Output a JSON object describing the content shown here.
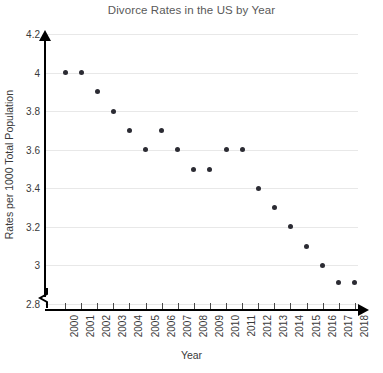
{
  "chart_data": {
    "type": "scatter",
    "title": "Divorce Rates in the US by Year",
    "xlabel": "Year",
    "ylabel": "Rates per 1000 Total Population",
    "categories": [
      "2000",
      "2001",
      "2002",
      "2003",
      "2004",
      "2005",
      "2006",
      "2007",
      "2008",
      "2009",
      "2010",
      "2011",
      "2012",
      "2013",
      "2014",
      "2015",
      "2016",
      "2017",
      "2018"
    ],
    "values": [
      4.0,
      4.0,
      3.9,
      3.8,
      3.7,
      3.6,
      3.7,
      3.6,
      3.5,
      3.5,
      3.6,
      3.6,
      3.4,
      3.3,
      3.2,
      3.1,
      3.0,
      2.91,
      2.91
    ],
    "ylim": [
      2.8,
      4.2
    ],
    "yticks": [
      "2.8",
      "3",
      "3.2",
      "3.4",
      "3.6",
      "3.8",
      "4",
      "4.2"
    ],
    "ytick_values": [
      2.8,
      3.0,
      3.2,
      3.4,
      3.6,
      3.8,
      4.0,
      4.2
    ],
    "grid": true,
    "legend": "none",
    "marker_color": "#2b2b33",
    "grid_color": "#e8e8e8",
    "axis_color": "#000000",
    "title_color": "#595959",
    "y_axis_break": true
  }
}
